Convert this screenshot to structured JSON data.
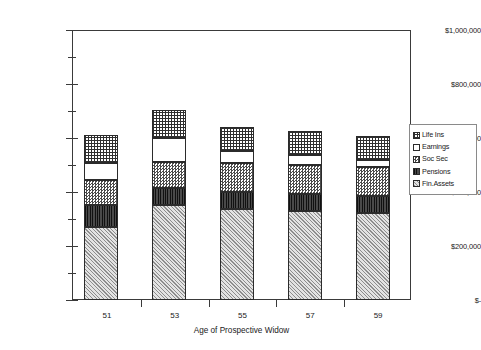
{
  "chart_data": {
    "type": "bar",
    "subtype": "stacked-column",
    "title": "",
    "xlabel": "Age of Prospective Widow",
    "ylabel": "",
    "categories": [
      "51",
      "53",
      "55",
      "57",
      "59"
    ],
    "ylim": [
      0,
      1000000
    ],
    "y_major_ticks": [
      0,
      200000,
      400000,
      600000,
      800000,
      1000000
    ],
    "y_tick_labels": [
      "$-",
      "$200,000",
      "$400,000",
      "$600,000",
      "$800,000",
      "$1,000,000"
    ],
    "y_minor_ticks": [
      100000,
      300000,
      500000,
      700000,
      900000
    ],
    "grid": false,
    "legend_position": "right",
    "stack_order_bottom_to_top": [
      "Fin.Assets",
      "Pensions",
      "Soc Sec",
      "Earnings",
      "Life Ins"
    ],
    "series": [
      {
        "name": "Fin.Assets",
        "values": [
          270000,
          352000,
          337000,
          330000,
          322000
        ]
      },
      {
        "name": "Pensions",
        "values": [
          81000,
          63000,
          63000,
          63000,
          63000
        ]
      },
      {
        "name": "Soc Sec",
        "values": [
          93000,
          96000,
          107000,
          107000,
          107000
        ]
      },
      {
        "name": "Earnings",
        "values": [
          63000,
          89000,
          44000,
          37000,
          26000
        ]
      },
      {
        "name": "Life Ins",
        "values": [
          104000,
          104000,
          89000,
          89000,
          89000
        ]
      }
    ],
    "totals": [
      611000,
      704000,
      640000,
      626000,
      607000
    ],
    "legend_entries": [
      {
        "label": "Life Ins",
        "pattern": "grid-crosshatch"
      },
      {
        "label": "Earnings",
        "pattern": "solid-white"
      },
      {
        "label": "Soc Sec",
        "pattern": "fine-checker"
      },
      {
        "label": "Pensions",
        "pattern": "dark-vertical-lines"
      },
      {
        "label": "Fin.Assets",
        "pattern": "light-diagonal-hatch"
      }
    ],
    "colors": {
      "axis": "#3a3a3a",
      "pattern_dark": "#2f2f2f",
      "pattern_light": "#d4d4d4",
      "background": "#ffffff"
    }
  }
}
